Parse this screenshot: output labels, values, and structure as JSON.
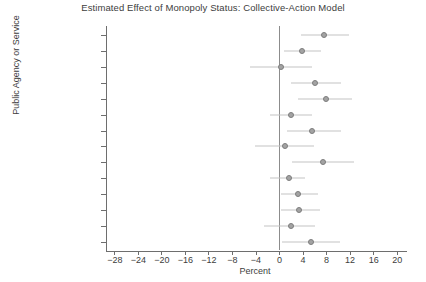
{
  "chart_data": {
    "type": "scatter",
    "title": "Estimated Effect of Monopoly Status: Collective-Action Model",
    "xlabel": "Percent",
    "ylabel": "Public Agency or Service",
    "xlim": [
      -29.5,
      21.5
    ],
    "xticks": [
      -28,
      -24,
      -20,
      -16,
      -12,
      -8,
      -4,
      0,
      4,
      8,
      12,
      16,
      20
    ],
    "xtick_labels": [
      "-28",
      "-24",
      "-20",
      "-16",
      "-12",
      "-8",
      "-4",
      "0",
      "4",
      "8",
      "12",
      "16",
      "20"
    ],
    "grid": false,
    "legend": null,
    "reference_line": 0,
    "categories": [
      "Courts",
      "Police",
      "Military",
      "Government",
      "Parliament",
      "Central Bank",
      "Health",
      "Education",
      "Roads",
      "Post",
      "Telephone",
      "Electricity",
      "Water",
      "Customs"
    ],
    "values": [
      7.5,
      3.8,
      0.3,
      6.1,
      7.9,
      2.0,
      5.6,
      0.9,
      7.4,
      1.6,
      3.1,
      3.3,
      2.0,
      5.3
    ],
    "ci_low": [
      3.6,
      0.8,
      -5.0,
      1.9,
      3.2,
      -1.6,
      1.3,
      -4.2,
      2.1,
      -1.6,
      0.2,
      0.2,
      -2.6,
      0.5
    ],
    "ci_high": [
      11.8,
      7.0,
      5.6,
      10.4,
      12.4,
      5.6,
      10.5,
      5.9,
      12.6,
      4.4,
      6.5,
      6.9,
      6.1,
      10.2
    ],
    "series_name": "Estimated effect (percentage points) with 95% confidence interval"
  },
  "colors": {
    "marker_fill": "#a3a3a3",
    "marker_edge": "#7d7d7d",
    "ci_line": "#c3c3c3",
    "axis": "#6e6e6e",
    "zero_line": "#8c8c8c",
    "text": "#3d3d3d",
    "background": "#ffffff"
  }
}
